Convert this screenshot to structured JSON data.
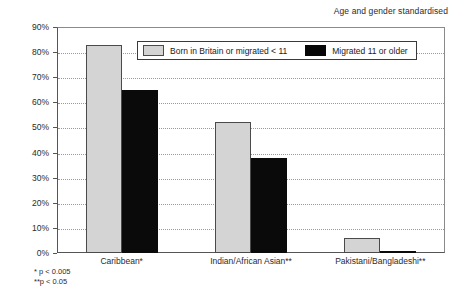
{
  "chart_data": {
    "type": "bar",
    "title": "Age and gender standardised",
    "xlabel": "",
    "ylabel": "",
    "ylim": [
      0,
      90
    ],
    "ytick_labels": [
      "90%",
      "80%",
      "70%",
      "60%",
      "50%",
      "40%",
      "30%",
      "20%",
      "10%",
      "0%"
    ],
    "ytick_values": [
      90,
      80,
      70,
      60,
      50,
      40,
      30,
      20,
      10,
      0
    ],
    "grid": true,
    "legend_position": "top-center",
    "categories": [
      "Caribbean*",
      "Indian/African Asian**",
      "Pakistani/Bangladeshi**"
    ],
    "series": [
      {
        "name": "Born in Britain or migrated < 11",
        "color": "#d4d4d4",
        "values": [
          83,
          52,
          6
        ]
      },
      {
        "name": "Migrated 11 or older",
        "color": "#070707",
        "values": [
          65,
          38,
          1
        ]
      }
    ],
    "annotations": [
      "* p < 0.005",
      "**p < 0.05"
    ]
  },
  "footnotes": {
    "line1": "* p < 0.005",
    "line2": "**p < 0.05"
  }
}
